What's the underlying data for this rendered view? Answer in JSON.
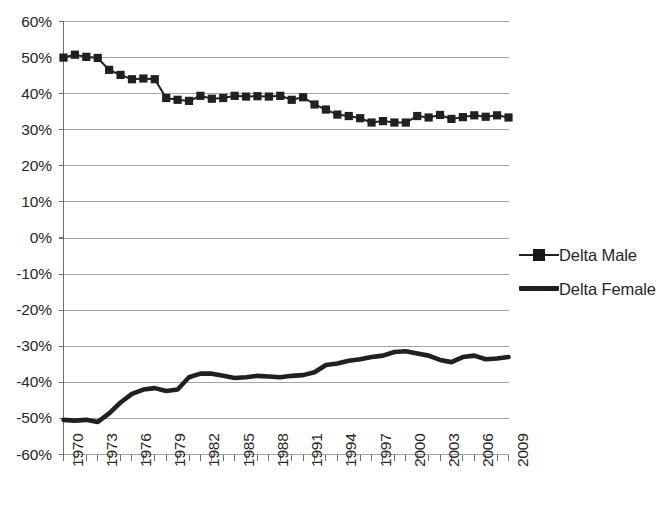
{
  "chart_data": {
    "type": "line",
    "title": "",
    "subtitle": "",
    "xlabel": "",
    "ylabel": "",
    "xlim": [
      1970,
      2009
    ],
    "ylim": [
      -60,
      60
    ],
    "y_tick_step": 10,
    "grid": true,
    "grid_axis": "y",
    "legend_position": "right",
    "units": "percent",
    "x": [
      1970,
      1971,
      1972,
      1973,
      1974,
      1975,
      1976,
      1977,
      1978,
      1979,
      1980,
      1981,
      1982,
      1983,
      1984,
      1985,
      1986,
      1987,
      1988,
      1989,
      1990,
      1991,
      1992,
      1993,
      1994,
      1995,
      1996,
      1997,
      1998,
      1999,
      2000,
      2001,
      2002,
      2003,
      2004,
      2005,
      2006,
      2007,
      2008,
      2009
    ],
    "y_tick_labels": [
      "60%",
      "50%",
      "40%",
      "30%",
      "20%",
      "10%",
      "0%",
      "-10%",
      "-20%",
      "-30%",
      "-40%",
      "-50%",
      "-60%"
    ],
    "y_tick_values": [
      60,
      50,
      40,
      30,
      20,
      10,
      0,
      -10,
      -20,
      -30,
      -40,
      -50,
      -60
    ],
    "x_tick_labels": [
      "1970",
      "1971",
      "1972",
      "1973",
      "1974",
      "1975",
      "1976",
      "1977",
      "1978",
      "1979",
      "1980",
      "1981",
      "1982",
      "1983",
      "1984",
      "1985",
      "1986",
      "1987",
      "1988",
      "1989",
      "1990",
      "1991",
      "1992",
      "1993",
      "1994",
      "1995",
      "1996",
      "1997",
      "1998",
      "1999",
      "2000",
      "2001",
      "2002",
      "2003",
      "2004",
      "2005",
      "2006",
      "2007",
      "2008",
      "2009"
    ],
    "x_tick_labels_shown": [
      "1970",
      "1973",
      "1976",
      "1979",
      "1982",
      "1985",
      "1988",
      "1991",
      "1994",
      "1997",
      "2000",
      "2003",
      "2006",
      "2009"
    ],
    "series": [
      {
        "name": "Delta Male",
        "color": "#231f20",
        "marker": "square",
        "values": [
          50.0,
          50.8,
          50.2,
          49.9,
          46.6,
          45.2,
          44.0,
          44.2,
          44.0,
          38.8,
          38.3,
          38.0,
          39.4,
          38.6,
          38.8,
          39.4,
          39.2,
          39.3,
          39.2,
          39.4,
          38.3,
          39.0,
          37.0,
          35.6,
          34.2,
          33.8,
          33.2,
          32.0,
          32.4,
          32.0,
          32.0,
          33.8,
          33.4,
          34.1,
          33.0,
          33.5,
          34.0,
          33.6,
          34.0,
          33.4
        ]
      },
      {
        "name": "Delta Female",
        "color": "#231f20",
        "marker": "none",
        "values": [
          -50.4,
          -50.6,
          -50.4,
          -51.0,
          -48.6,
          -45.6,
          -43.2,
          -42.0,
          -41.6,
          -42.4,
          -42.0,
          -38.6,
          -37.6,
          -37.6,
          -38.2,
          -38.8,
          -38.6,
          -38.2,
          -38.4,
          -38.6,
          -38.2,
          -38.0,
          -37.2,
          -35.2,
          -34.8,
          -34.0,
          -33.6,
          -33.0,
          -32.6,
          -31.6,
          -31.4,
          -32.0,
          -32.6,
          -33.8,
          -34.4,
          -33.0,
          -32.6,
          -33.6,
          -33.4,
          -33.0
        ]
      }
    ]
  },
  "legend": {
    "items": [
      {
        "label": "Delta Male",
        "key": "line-square-marker"
      },
      {
        "label": "Delta Female",
        "key": "line-thick"
      }
    ]
  }
}
